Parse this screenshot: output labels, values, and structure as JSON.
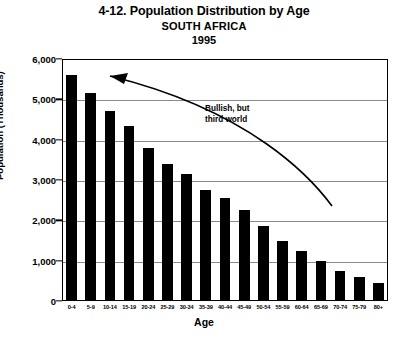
{
  "chart_data": {
    "type": "bar",
    "title": "4-12. Population Distribution by Age",
    "subtitle": "SOUTH AFRICA",
    "year_label": "1995",
    "xlabel": "Age",
    "ylabel": "Population (Thousands)",
    "ylim": [
      0,
      6000
    ],
    "ytick_values": [
      0,
      1000,
      2000,
      3000,
      4000,
      5000,
      6000
    ],
    "ytick_labels": [
      "0",
      "1,000",
      "2,000",
      "3,000",
      "4,000",
      "5,000",
      "6,000"
    ],
    "grid": true,
    "legend": "none",
    "bar_color": "#000000",
    "categories": [
      "0-4",
      "5-9",
      "10-14",
      "15-19",
      "20-24",
      "25-29",
      "30-34",
      "35-39",
      "40-44",
      "45-49",
      "50-54",
      "55-59",
      "60-64",
      "65-69",
      "70-74",
      "75-79",
      "80+"
    ],
    "values": [
      5600,
      5150,
      4700,
      4350,
      3800,
      3400,
      3150,
      2750,
      2550,
      2250,
      1850,
      1500,
      1250,
      1000,
      750,
      600,
      450
    ],
    "annotations": [
      {
        "text_line1": "Bullish, but",
        "text_line2": "third world",
        "arrow": "curved-arrow-pointing-left-to-tall-bars"
      }
    ]
  }
}
